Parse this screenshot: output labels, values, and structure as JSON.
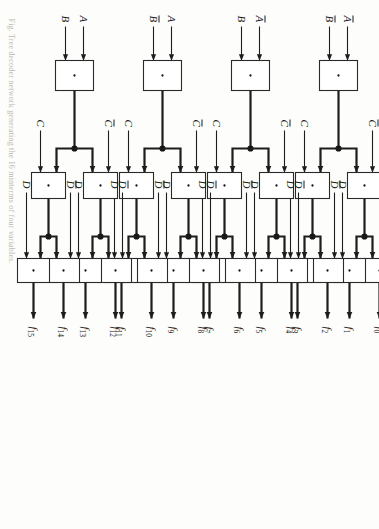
{
  "figure": {
    "type": "logic-diagram",
    "orientation_note": "page scanned rotated 90 degrees",
    "caption": "Fig.  Tree decoder network generating the 16 minterms of four variables.",
    "gate_symbol": "·",
    "colors": {
      "wire": "#1d1d1d",
      "box_stroke": "#2a2a2a",
      "box_fill": "#ffffff",
      "paper": "#fdfdfb",
      "label": "#1a1a1a",
      "caption": "#b9b9b4"
    }
  },
  "stages": {
    "stage1_label": "AB stage",
    "stage2_label": "C stage",
    "stage3_label": "D stage"
  },
  "groups": [
    {
      "id": "g0",
      "inputs": [
        {
          "name": "A-bar",
          "text": "A",
          "bar": true
        },
        {
          "name": "B-bar",
          "text": "B",
          "bar": true
        }
      ],
      "c_inputs": [
        {
          "name": "C-bar",
          "text": "C",
          "bar": true
        },
        {
          "name": "C",
          "text": "C",
          "bar": false
        }
      ],
      "d_inputs": [
        {
          "name": "D-bar",
          "text": "D",
          "bar": true
        },
        {
          "name": "D",
          "text": "D",
          "bar": false
        },
        {
          "name": "D-bar",
          "text": "D",
          "bar": true
        },
        {
          "name": "D",
          "text": "D",
          "bar": false
        }
      ],
      "outputs": [
        {
          "name": "f0",
          "text": "f",
          "sub": "0"
        },
        {
          "name": "f1",
          "text": "f",
          "sub": "1"
        },
        {
          "name": "f2",
          "text": "f",
          "sub": "2"
        },
        {
          "name": "f3",
          "text": "f",
          "sub": "3"
        }
      ]
    },
    {
      "id": "g1",
      "inputs": [
        {
          "name": "A-bar",
          "text": "A",
          "bar": true
        },
        {
          "name": "B",
          "text": "B",
          "bar": false
        }
      ],
      "c_inputs": [
        {
          "name": "C-bar",
          "text": "C",
          "bar": true
        },
        {
          "name": "C",
          "text": "C",
          "bar": false
        }
      ],
      "d_inputs": [
        {
          "name": "D-bar",
          "text": "D",
          "bar": true
        },
        {
          "name": "D",
          "text": "D",
          "bar": false
        },
        {
          "name": "D-bar",
          "text": "D",
          "bar": true
        },
        {
          "name": "D",
          "text": "D",
          "bar": false
        }
      ],
      "outputs": [
        {
          "name": "f4",
          "text": "f",
          "sub": "4"
        },
        {
          "name": "f5",
          "text": "f",
          "sub": "5"
        },
        {
          "name": "f6",
          "text": "f",
          "sub": "6"
        },
        {
          "name": "f7",
          "text": "f",
          "sub": "7"
        }
      ]
    },
    {
      "id": "g2",
      "inputs": [
        {
          "name": "A",
          "text": "A",
          "bar": false
        },
        {
          "name": "B-bar",
          "text": "B",
          "bar": true
        }
      ],
      "c_inputs": [
        {
          "name": "C-bar",
          "text": "C",
          "bar": true
        },
        {
          "name": "C",
          "text": "C",
          "bar": false
        }
      ],
      "d_inputs": [
        {
          "name": "D-bar",
          "text": "D",
          "bar": true
        },
        {
          "name": "D",
          "text": "D",
          "bar": false
        },
        {
          "name": "D-bar",
          "text": "D",
          "bar": true
        },
        {
          "name": "D",
          "text": "D",
          "bar": false
        }
      ],
      "outputs": [
        {
          "name": "f8",
          "text": "f",
          "sub": "8"
        },
        {
          "name": "f9",
          "text": "f",
          "sub": "9"
        },
        {
          "name": "f10",
          "text": "f",
          "sub": "10"
        },
        {
          "name": "f11",
          "text": "f",
          "sub": "11"
        }
      ]
    },
    {
      "id": "g3",
      "inputs": [
        {
          "name": "A",
          "text": "A",
          "bar": false
        },
        {
          "name": "B",
          "text": "B",
          "bar": false
        }
      ],
      "c_inputs": [
        {
          "name": "C-bar",
          "text": "C",
          "bar": true
        },
        {
          "name": "C",
          "text": "C",
          "bar": false
        }
      ],
      "d_inputs": [
        {
          "name": "D-bar",
          "text": "D",
          "bar": true
        },
        {
          "name": "D",
          "text": "D",
          "bar": false
        },
        {
          "name": "D-bar",
          "text": "D",
          "bar": true
        },
        {
          "name": "D",
          "text": "D",
          "bar": false
        }
      ],
      "outputs": [
        {
          "name": "f12",
          "text": "f",
          "sub": "12"
        },
        {
          "name": "f13",
          "text": "f",
          "sub": "13"
        },
        {
          "name": "f14",
          "text": "f",
          "sub": "14"
        },
        {
          "name": "f15",
          "text": "f",
          "sub": "15"
        }
      ]
    }
  ]
}
